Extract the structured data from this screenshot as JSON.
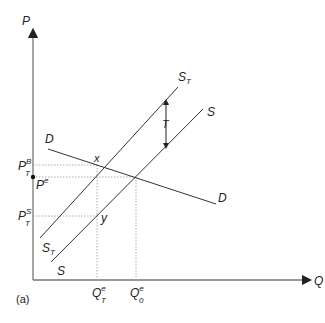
{
  "diagram": {
    "panel_label": "(a)",
    "axes": {
      "y_label": "P",
      "x_label": "Q"
    },
    "curves": {
      "demand": {
        "label_top": "D",
        "label_bottom": "D"
      },
      "supply": {
        "label_top": "S",
        "label_bottom": "S"
      },
      "supply_tax": {
        "label_main": "S",
        "label_sub": "T",
        "label_bottom_main": "S",
        "label_bottom_sub": "T"
      }
    },
    "tax_label": "T",
    "points": {
      "x": "x",
      "y": "y"
    },
    "price_labels": {
      "buyer": {
        "main": "P",
        "sup": "B",
        "sub": "T"
      },
      "equilibrium": {
        "main": "P",
        "sup": "e"
      },
      "seller": {
        "main": "P",
        "sup": "S",
        "sub": "T"
      }
    },
    "quantity_labels": {
      "tax": {
        "main": "Q",
        "sup": "e",
        "sub": "T"
      },
      "original": {
        "main": "Q",
        "sup": "e",
        "sub": "0"
      }
    },
    "colors": {
      "curve": "#333333",
      "axis": "#777777",
      "guide": "#999999"
    }
  }
}
